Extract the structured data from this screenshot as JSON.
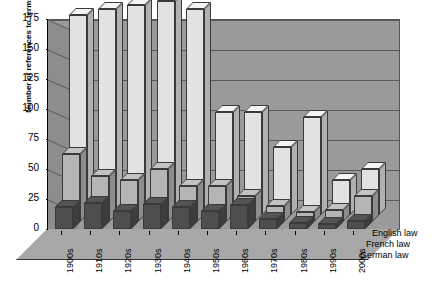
{
  "chart_data": {
    "type": "bar",
    "subtype": "3d-grouped-bar",
    "title": "",
    "xlabel": "",
    "ylabel": "Number of references to terms",
    "ylim": [
      0,
      175
    ],
    "yticks": [
      0,
      25,
      50,
      75,
      100,
      125,
      150,
      175
    ],
    "grid": true,
    "legend_position": "right-depth-axis",
    "categories": [
      "1900s",
      "1910s",
      "1920s",
      "1930s",
      "1940s",
      "1950s",
      "1960s",
      "1970s",
      "1980s",
      "1990s",
      "2000s"
    ],
    "series": [
      {
        "name": "English law",
        "color": "#e2e2e2",
        "values": [
          167,
          172,
          175,
          178,
          172,
          86,
          86,
          57,
          82,
          29,
          38
        ]
      },
      {
        "name": "French law",
        "color": "#b5b5b5",
        "values": [
          57,
          38,
          35,
          44,
          30,
          30,
          22,
          13,
          8,
          10,
          22
        ]
      },
      {
        "name": "German law",
        "color": "#4e4e4e",
        "values": [
          18,
          22,
          15,
          21,
          18,
          15,
          20,
          8,
          5,
          4,
          7
        ]
      }
    ]
  },
  "axis": {
    "y_label": "Number of references to terms",
    "y_ticks": [
      "175",
      "150",
      "125",
      "100",
      "75",
      "50",
      "25",
      "0"
    ],
    "x_ticks": [
      "1900s",
      "1910s",
      "1920s",
      "1930s",
      "1940s",
      "1950s",
      "1960s",
      "1970s",
      "1980s",
      "1990s",
      "2000s"
    ]
  },
  "legend": {
    "items": [
      {
        "label": "English law"
      },
      {
        "label": "French law"
      },
      {
        "label": "German law"
      }
    ]
  }
}
